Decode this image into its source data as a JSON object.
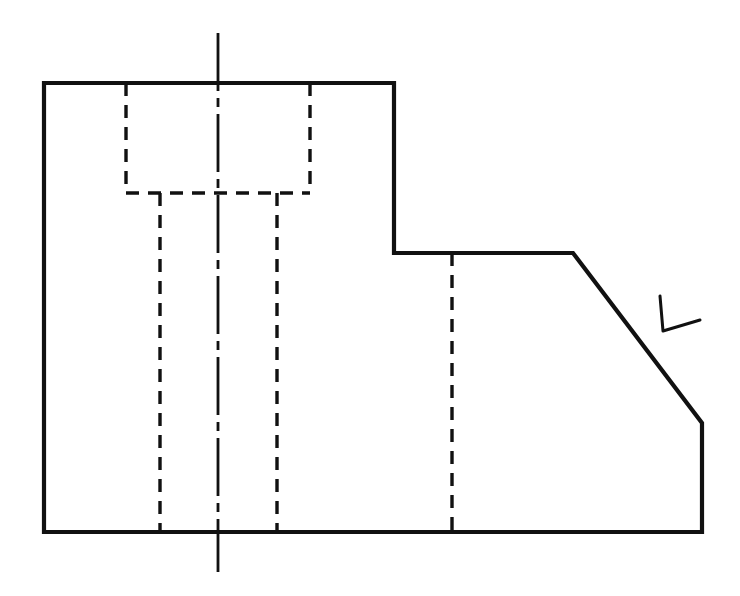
{
  "document": {
    "type": "engineering-drawing",
    "view": "front-orthographic-view",
    "title": "",
    "background_color": "#ffffff",
    "ink_color": "#111111"
  },
  "drawing": {
    "units": "pixels",
    "canvas": {
      "width": 740,
      "height": 596
    },
    "line_styles": {
      "object_line": {
        "name": "visible-object-line",
        "width": 4.2,
        "dash": "solid",
        "color": "#111111"
      },
      "hidden_line": {
        "name": "hidden-line",
        "width": 3.4,
        "dash": "13,9",
        "color": "#111111"
      },
      "center_line": {
        "name": "center-line",
        "width": 2.8,
        "dash": "58,7,9,7",
        "color": "#111111"
      },
      "annotation_line": {
        "name": "freehand-annotation",
        "width": 3.0,
        "dash": "solid",
        "color": "#111111"
      }
    },
    "outline": {
      "name": "part-outline",
      "closed": true,
      "points": [
        [
          44,
          83
        ],
        [
          394,
          83
        ],
        [
          394,
          253
        ],
        [
          573,
          253
        ],
        [
          702,
          423
        ],
        [
          702,
          532
        ],
        [
          44,
          532
        ]
      ],
      "vertex_labels": [
        "top-left-corner",
        "top-right-corner-upper-block",
        "step-inside-corner",
        "chamfer-start",
        "chamfer-end",
        "bottom-right-corner",
        "bottom-left-corner"
      ]
    },
    "hidden_lines": [
      {
        "name": "counterbore-left-wall",
        "x1": 126,
        "y1": 83,
        "x2": 126,
        "y2": 193
      },
      {
        "name": "counterbore-right-wall",
        "x1": 310,
        "y1": 83,
        "x2": 310,
        "y2": 193
      },
      {
        "name": "counterbore-floor",
        "x1": 126,
        "y1": 193,
        "x2": 310,
        "y2": 193
      },
      {
        "name": "slot-left-wall",
        "x1": 160,
        "y1": 193,
        "x2": 160,
        "y2": 532
      },
      {
        "name": "slot-right-wall",
        "x1": 277,
        "y1": 193,
        "x2": 277,
        "y2": 532
      },
      {
        "name": "right-block-hidden-edge",
        "x1": 452,
        "y1": 253,
        "x2": 452,
        "y2": 532
      }
    ],
    "center_lines": [
      {
        "name": "vertical-centerline",
        "x1": 218,
        "y1": 33,
        "x2": 218,
        "y2": 572
      }
    ],
    "annotations": [
      {
        "name": "chamfer-angle-mark",
        "symbol": "L",
        "description": "hand-drawn angle check mark pointing at chamfer face",
        "points": [
          [
            660,
            296
          ],
          [
            663,
            331
          ],
          [
            700,
            320
          ]
        ]
      }
    ]
  },
  "legend": {
    "object_line_label": "Visible edge",
    "hidden_line_label": "Hidden edge",
    "center_line_label": "Center line",
    "annotation_label": "Angle mark"
  }
}
